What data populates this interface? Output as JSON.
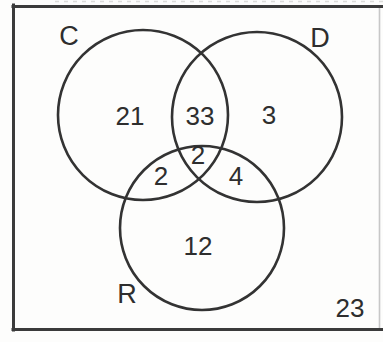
{
  "diagram": {
    "kind": "three-set venn diagram",
    "set_labels": {
      "c": "C",
      "d": "D",
      "r": "R"
    },
    "regions": {
      "c_only": "21",
      "c_and_d_only": "33",
      "d_only": "3",
      "c_and_d_and_r": "2",
      "c_and_r_only": "2",
      "d_and_r_only": "4",
      "r_only": "12",
      "outside_all_sets": "23"
    },
    "colors": {
      "circle_stroke": "#333333",
      "text": "#2e2e2e",
      "frame_dark": "#3b3b3b",
      "frame_light_right": "#c7c7c7",
      "background": "#fdfdfc"
    }
  }
}
